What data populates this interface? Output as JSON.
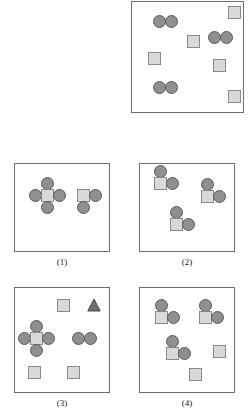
{
  "figure": {
    "width": 249,
    "height": 417,
    "background": "#ffffff",
    "colors": {
      "circle_fill": "#8f8f8f",
      "circle_stroke": "#5a5a5a",
      "square_fill": "#d9d9d9",
      "square_stroke": "#8a8a8a",
      "triangle_fill": "#6e6e6e",
      "triangle_stroke": "#4a4a4a",
      "panel_border": "#6e6e6e",
      "caption_color": "#1a1a1a"
    },
    "sizes": {
      "circle_diameter": 13,
      "square_side": 13,
      "triangle_side": 14
    }
  },
  "panels": [
    {
      "id": "panel-top-right",
      "caption": "",
      "x": 131,
      "y": 1,
      "width": 113,
      "height": 112,
      "shapes": [
        {
          "type": "circle",
          "x": 21,
          "y": 13
        },
        {
          "type": "circle",
          "x": 33,
          "y": 13
        },
        {
          "type": "square",
          "x": 96,
          "y": 4
        },
        {
          "type": "square",
          "x": 55,
          "y": 33
        },
        {
          "type": "circle",
          "x": 76,
          "y": 29
        },
        {
          "type": "circle",
          "x": 88,
          "y": 29
        },
        {
          "type": "square",
          "x": 16,
          "y": 50
        },
        {
          "type": "square",
          "x": 81,
          "y": 57
        },
        {
          "type": "circle",
          "x": 21,
          "y": 79
        },
        {
          "type": "circle",
          "x": 33,
          "y": 79
        },
        {
          "type": "square",
          "x": 96,
          "y": 88
        }
      ]
    },
    {
      "id": "panel-1",
      "caption": "(1)",
      "x": 14,
      "y": 163,
      "width": 96,
      "height": 89,
      "shapes": [
        {
          "type": "circle",
          "x": 26,
          "y": 13
        },
        {
          "type": "circle",
          "x": 14,
          "y": 25
        },
        {
          "type": "square",
          "x": 26,
          "y": 25
        },
        {
          "type": "circle",
          "x": 38,
          "y": 25
        },
        {
          "type": "circle",
          "x": 26,
          "y": 37
        },
        {
          "type": "square",
          "x": 62,
          "y": 25
        },
        {
          "type": "circle",
          "x": 74,
          "y": 25
        },
        {
          "type": "circle",
          "x": 62,
          "y": 37
        }
      ]
    },
    {
      "id": "panel-2",
      "caption": "(2)",
      "x": 139,
      "y": 163,
      "width": 96,
      "height": 89,
      "shapes": [
        {
          "type": "circle",
          "x": 14,
          "y": 1
        },
        {
          "type": "square",
          "x": 14,
          "y": 13
        },
        {
          "type": "circle",
          "x": 26,
          "y": 13
        },
        {
          "type": "circle",
          "x": 61,
          "y": 14
        },
        {
          "type": "square",
          "x": 61,
          "y": 26
        },
        {
          "type": "circle",
          "x": 73,
          "y": 26
        },
        {
          "type": "circle",
          "x": 30,
          "y": 42
        },
        {
          "type": "square",
          "x": 30,
          "y": 54
        },
        {
          "type": "circle",
          "x": 42,
          "y": 54
        }
      ]
    },
    {
      "id": "panel-3",
      "caption": "(3)",
      "x": 14,
      "y": 287,
      "width": 96,
      "height": 106,
      "shapes": [
        {
          "type": "square",
          "x": 42,
          "y": 11
        },
        {
          "type": "triangle",
          "x": 72,
          "y": 10
        },
        {
          "type": "circle",
          "x": 15,
          "y": 32
        },
        {
          "type": "circle",
          "x": 3,
          "y": 44
        },
        {
          "type": "square",
          "x": 15,
          "y": 44
        },
        {
          "type": "circle",
          "x": 27,
          "y": 44
        },
        {
          "type": "circle",
          "x": 15,
          "y": 56
        },
        {
          "type": "circle",
          "x": 57,
          "y": 44
        },
        {
          "type": "circle",
          "x": 69,
          "y": 44
        },
        {
          "type": "square",
          "x": 13,
          "y": 78
        },
        {
          "type": "square",
          "x": 52,
          "y": 78
        }
      ]
    },
    {
      "id": "panel-4",
      "caption": "(4)",
      "x": 139,
      "y": 287,
      "width": 96,
      "height": 106,
      "shapes": [
        {
          "type": "circle",
          "x": 15,
          "y": 11
        },
        {
          "type": "square",
          "x": 15,
          "y": 23
        },
        {
          "type": "circle",
          "x": 27,
          "y": 23
        },
        {
          "type": "circle",
          "x": 59,
          "y": 11
        },
        {
          "type": "square",
          "x": 59,
          "y": 23
        },
        {
          "type": "circle",
          "x": 71,
          "y": 23
        },
        {
          "type": "circle",
          "x": 26,
          "y": 47
        },
        {
          "type": "square",
          "x": 26,
          "y": 59
        },
        {
          "type": "circle",
          "x": 38,
          "y": 59
        },
        {
          "type": "square",
          "x": 73,
          "y": 57
        },
        {
          "type": "square",
          "x": 49,
          "y": 80
        }
      ]
    }
  ]
}
